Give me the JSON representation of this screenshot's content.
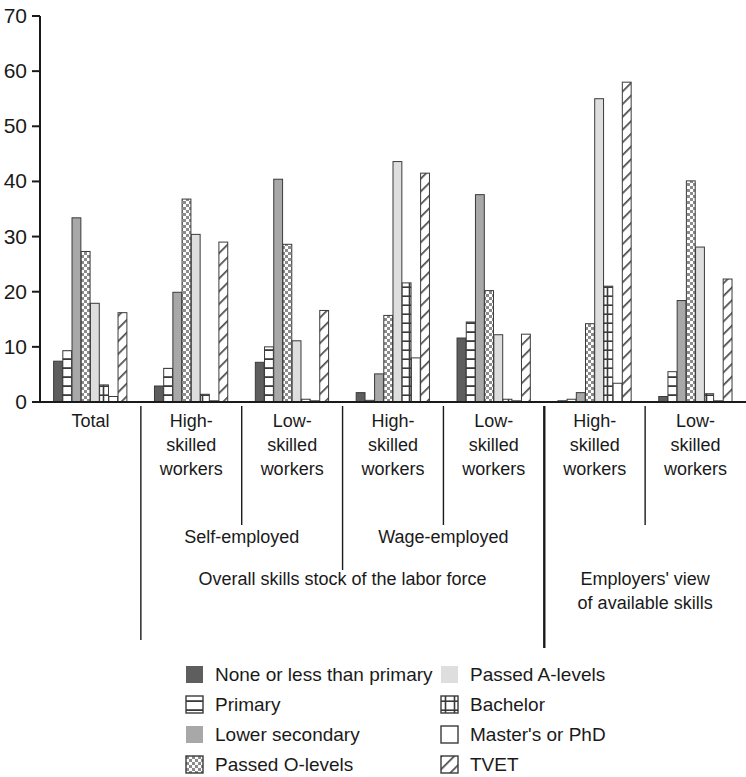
{
  "chart_data": {
    "type": "bar",
    "title": "",
    "subtitle": "",
    "xlabel": "",
    "ylabel": "",
    "ylim": [
      0,
      70
    ],
    "yticks": [
      0,
      10,
      20,
      30,
      40,
      50,
      60,
      70
    ],
    "grid": false,
    "legend_position": "bottom",
    "categories": [
      "Total",
      "High-skilled workers",
      "Low-skilled workers",
      "High-skilled workers",
      "Low-skilled workers",
      "High-skilled workers",
      "Low-skilled workers"
    ],
    "category_lines": [
      [
        "Total"
      ],
      [
        "High-",
        "skilled",
        "workers"
      ],
      [
        "Low-",
        "skilled",
        "workers"
      ],
      [
        "High-",
        "skilled",
        "workers"
      ],
      [
        "Low-",
        "skilled",
        "workers"
      ],
      [
        "High-",
        "skilled",
        "workers"
      ],
      [
        "Low-",
        "skilled",
        "workers"
      ]
    ],
    "group_tier1": [
      {
        "label": "Self-employed",
        "categories": [
          1,
          2
        ]
      },
      {
        "label": "Wage-employed",
        "categories": [
          3,
          4
        ]
      }
    ],
    "group_tier2": [
      {
        "label": "Overall skills stock of the labor force",
        "categories": [
          1,
          2,
          3,
          4
        ]
      },
      {
        "label": "Employers' view of available skills",
        "lines": [
          "Employers' view",
          "of available skills"
        ],
        "categories": [
          5,
          6
        ]
      }
    ],
    "series": [
      {
        "name": "None or less than primary",
        "pattern": "solid-dark",
        "color": "#595959",
        "values": [
          7.4,
          2.9,
          7.2,
          1.7,
          11.6,
          0.2,
          1.0
        ]
      },
      {
        "name": "Primary",
        "pattern": "horizontal-lines",
        "color": "#ffffff",
        "values": [
          9.3,
          6.1,
          10.0,
          0.3,
          14.5,
          0.5,
          5.5
        ]
      },
      {
        "name": "Lower secondary",
        "pattern": "solid-mid",
        "color": "#a6a6a6",
        "values": [
          33.4,
          19.9,
          40.4,
          5.1,
          37.6,
          1.7,
          18.4
        ]
      },
      {
        "name": "Passed O-levels",
        "pattern": "checker",
        "color": "#ffffff",
        "values": [
          27.3,
          36.8,
          28.6,
          15.7,
          20.2,
          14.2,
          40.1
        ]
      },
      {
        "name": "Passed A-levels",
        "pattern": "solid-light",
        "color": "#d9d9d9",
        "values": [
          17.9,
          30.4,
          11.1,
          43.6,
          12.2,
          55.0,
          28.1
        ]
      },
      {
        "name": "Bachelor",
        "pattern": "grid-lines",
        "color": "#ffffff",
        "values": [
          3.1,
          1.4,
          0.5,
          21.6,
          0.5,
          21.0,
          1.5
        ]
      },
      {
        "name": "Master's or PhD",
        "pattern": "open",
        "color": "#ffffff",
        "values": [
          1.0,
          0.2,
          0.2,
          8.0,
          0.2,
          3.4,
          0.2
        ]
      },
      {
        "name": "TVET",
        "pattern": "diagonal",
        "color": "#ffffff",
        "values": [
          16.2,
          29.0,
          16.6,
          41.5,
          12.3,
          58.0,
          22.3
        ]
      }
    ]
  },
  "legend": {
    "items": [
      {
        "label": "None or less than primary",
        "swatch": "solid-dark"
      },
      {
        "label": "Primary",
        "swatch": "horizontal-lines"
      },
      {
        "label": "Lower secondary",
        "swatch": "solid-mid"
      },
      {
        "label": "Passed O-levels",
        "swatch": "checker"
      },
      {
        "label": "Passed A-levels",
        "swatch": "solid-light"
      },
      {
        "label": "Bachelor",
        "swatch": "grid-lines"
      },
      {
        "label": "Master's or PhD",
        "swatch": "open"
      },
      {
        "label": "TVET",
        "swatch": "diagonal"
      }
    ]
  }
}
